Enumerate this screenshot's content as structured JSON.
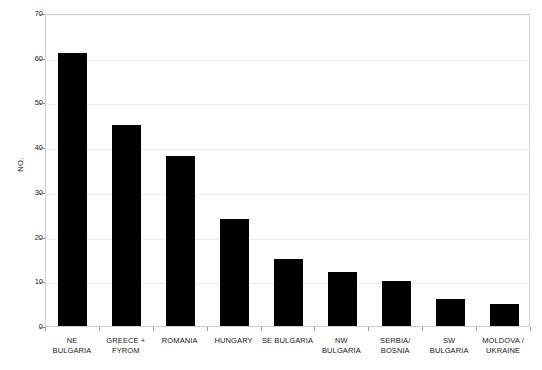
{
  "chart_data": {
    "type": "bar",
    "title": "",
    "xlabel": "",
    "ylabel": "NO.",
    "ylim": [
      0,
      70
    ],
    "ytick_step": 10,
    "yticks": [
      70,
      60,
      50,
      40,
      30,
      20,
      10,
      0
    ],
    "grid": true,
    "legend": null,
    "bar_color": "#000000",
    "categories": [
      "NE BULGARIA",
      "GREECE + FYROM",
      "ROMANIA",
      "HUNGARY",
      "SE BULGARIA",
      "NW BULGARIA",
      "SERBIA/ BOSNIA",
      "SW BULGARIA",
      "MOLDOVA / UKRAINE"
    ],
    "category_lines": [
      [
        "NE",
        "BULGARIA"
      ],
      [
        "GREECE +",
        "FYROM"
      ],
      [
        "ROMANIA",
        ""
      ],
      [
        "HUNGARY",
        ""
      ],
      [
        "SE BULGARIA",
        ""
      ],
      [
        "NW",
        "BULGARIA"
      ],
      [
        "SERBIA/",
        "BOSNIA"
      ],
      [
        "SW",
        "BULGARIA"
      ],
      [
        "MOLDOVA /",
        "UKRAINE"
      ]
    ],
    "values": [
      61,
      45,
      38,
      24,
      15,
      12,
      10,
      6,
      5
    ]
  }
}
